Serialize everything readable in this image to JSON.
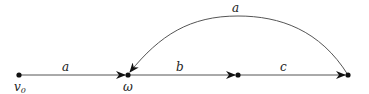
{
  "diagram": {
    "nodes": [
      {
        "id": "v0",
        "label": "v",
        "subscript": "0",
        "x": 19,
        "y": 75
      },
      {
        "id": "omega",
        "label": "ω",
        "x": 128,
        "y": 75
      },
      {
        "id": "n2",
        "label": "",
        "x": 238,
        "y": 75
      },
      {
        "id": "n3",
        "label": "",
        "x": 348,
        "y": 75
      }
    ],
    "edges": [
      {
        "from": "v0",
        "to": "omega",
        "label": "a"
      },
      {
        "from": "omega",
        "to": "n2",
        "label": "b"
      },
      {
        "from": "n2",
        "to": "n3",
        "label": "c"
      },
      {
        "from": "n3",
        "to": "omega",
        "label": "a",
        "curved": true
      }
    ],
    "colors": {
      "edge": "#555555",
      "node": "#111111"
    }
  }
}
